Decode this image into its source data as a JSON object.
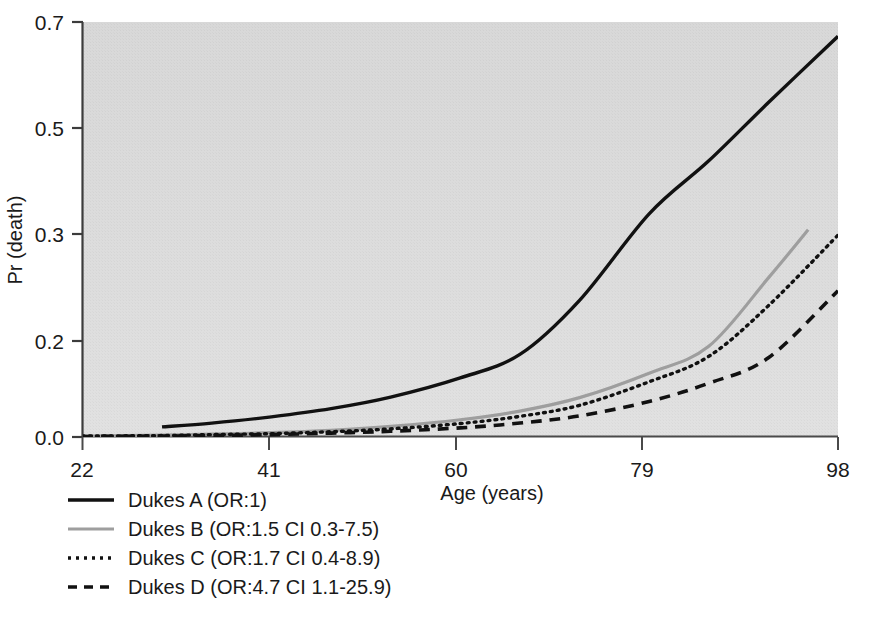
{
  "figure": {
    "background_color": "#ffffff",
    "panel_color": "#d9d9d9",
    "axis_color": "#3c3c3c"
  },
  "chart_data": {
    "type": "line",
    "title": "",
    "xlabel": "Age (years)",
    "ylabel": "Pr (death)",
    "xlim": [
      22,
      98
    ],
    "ylim": [
      0.0,
      0.7
    ],
    "grid": false,
    "legend_position": "bottom-left",
    "x_tick_labels": [
      "22",
      "41",
      "60",
      "79",
      "98"
    ],
    "x_ticks": [
      22,
      41,
      60,
      79,
      98
    ],
    "y_tick_labels": [
      "0.0",
      "0.2",
      "0.3",
      "0.5",
      "0.7"
    ],
    "y_ticks": [
      0.0,
      0.2,
      0.3,
      0.5,
      0.7
    ],
    "x": [
      30,
      35,
      41,
      47,
      53,
      60,
      66,
      72,
      79,
      85,
      91,
      98
    ],
    "series": [
      {
        "name": "Dukes A (OR:1)",
        "style": "solid",
        "color": "#111111",
        "width": 3.4,
        "x": [
          30,
          35,
          41,
          47,
          53,
          60,
          66,
          72,
          79,
          85,
          91,
          98
        ],
        "values": [
          0.021,
          0.029,
          0.042,
          0.059,
          0.083,
          0.123,
          0.172,
          0.238,
          0.338,
          0.438,
          0.548,
          0.673
        ]
      },
      {
        "name": "Dukes B (OR:1.5 CI 0.3-7.5)",
        "style": "solid",
        "color": "#9e9e9e",
        "width": 3.2,
        "x": [
          22,
          30,
          35,
          41,
          47,
          53,
          60,
          66,
          72,
          79,
          85,
          91,
          95
        ],
        "values": [
          0.002,
          0.004,
          0.006,
          0.009,
          0.014,
          0.022,
          0.036,
          0.054,
          0.082,
          0.133,
          0.189,
          0.259,
          0.308
        ]
      },
      {
        "name": "Dukes C (OR:1.7 CI 0.4-8.9)",
        "style": "dotted",
        "color": "#111111",
        "width": 3.4,
        "x": [
          22,
          30,
          35,
          41,
          47,
          53,
          60,
          66,
          72,
          79,
          85,
          91,
          98
        ],
        "values": [
          0.002,
          0.003,
          0.005,
          0.007,
          0.011,
          0.017,
          0.028,
          0.043,
          0.066,
          0.115,
          0.168,
          0.233,
          0.299
        ]
      },
      {
        "name": "Dukes D (OR:4.7 CI 1.1-25.9)",
        "style": "dashed",
        "color": "#111111",
        "width": 3.6,
        "x": [
          22,
          30,
          35,
          41,
          47,
          53,
          60,
          66,
          72,
          79,
          85,
          91,
          98
        ],
        "values": [
          0.001,
          0.002,
          0.003,
          0.005,
          0.008,
          0.012,
          0.019,
          0.029,
          0.044,
          0.074,
          0.112,
          0.165,
          0.247
        ]
      }
    ]
  },
  "legend": {
    "items": [
      {
        "label": "Dukes A (OR:1)",
        "style": "solid",
        "color": "#111111"
      },
      {
        "label": "Dukes B (OR:1.5 CI 0.3-7.5)",
        "style": "solid",
        "color": "#9e9e9e"
      },
      {
        "label": "Dukes C (OR:1.7 CI 0.4-8.9)",
        "style": "dotted",
        "color": "#111111"
      },
      {
        "label": "Dukes D (OR:4.7 CI 1.1-25.9)",
        "style": "dashed",
        "color": "#111111"
      }
    ]
  },
  "axes": {
    "x_title": "Age (years)",
    "y_title": "Pr (death)",
    "x_tick_0": "22",
    "x_tick_1": "41",
    "x_tick_2": "60",
    "x_tick_3": "79",
    "x_tick_4": "98",
    "y_tick_0": "0.7",
    "y_tick_1": "0.5",
    "y_tick_2": "0.3",
    "y_tick_3": "0.2",
    "y_tick_4": "0.0"
  }
}
